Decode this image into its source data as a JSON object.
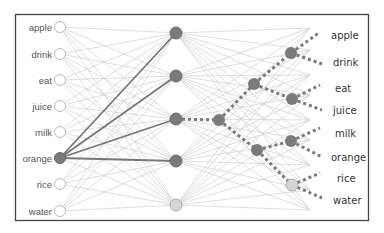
{
  "diagram": {
    "type": "neural-network",
    "input_labels": [
      "apple",
      "drink",
      "eat",
      "juice",
      "milk",
      "orange",
      "rice",
      "water"
    ],
    "active_input": "orange",
    "output_labels": [
      "apple",
      "drink",
      "eat",
      "juice",
      "milk",
      "orange",
      "rice",
      "water"
    ],
    "colors": {
      "frame": "#444444",
      "edge_light": "#d0d0d0",
      "edge_strong": "#777777",
      "node_active": "#7a7a7a",
      "node_inactive_fill": "#ffffff",
      "node_inactive_stroke": "#bbbbbb",
      "node_light": "#d6d6d6",
      "dotted": "#7a7a7a"
    },
    "layers": {
      "input": [
        [
          60,
          27
        ],
        [
          60,
          54
        ],
        [
          60,
          80
        ],
        [
          60,
          106
        ],
        [
          60,
          132
        ],
        [
          60,
          158
        ],
        [
          60,
          184
        ],
        [
          60,
          211
        ]
      ],
      "hidden": [
        [
          176,
          33
        ],
        [
          176,
          76
        ],
        [
          176,
          119
        ],
        [
          176,
          161
        ],
        [
          176,
          205
        ]
      ],
      "center": [
        [
          219,
          120
        ]
      ],
      "branch": [
        [
          254,
          84
        ],
        [
          257,
          150
        ]
      ],
      "leaf": [
        [
          291,
          53
        ],
        [
          292,
          99
        ],
        [
          291,
          141
        ],
        [
          292,
          185
        ]
      ]
    }
  }
}
